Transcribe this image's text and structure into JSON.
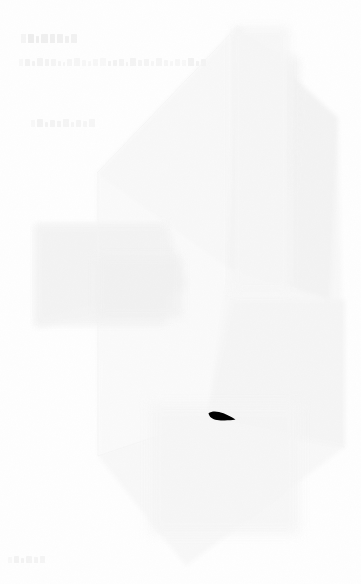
{
  "canvas": {
    "width": 361,
    "height": 584,
    "background_color": "#fefefe",
    "description": "Extremely faded near-white screenshot with illegible text and a large ghost polygon"
  },
  "palette": {
    "background": "#fefefe",
    "ghost_light": "#f9f9f9",
    "ghost_mid": "#f4f4f4",
    "ghost_dark": "#efefef",
    "text_ghost": "#f2f2f2",
    "cursor": "#000000"
  },
  "text_blocks": [
    {
      "name": "title",
      "legible": false,
      "text": "",
      "x": 21,
      "y": 34,
      "width": 48,
      "height": 12,
      "glyph_widths": [
        5,
        6,
        3,
        7,
        5,
        6,
        4,
        6
      ],
      "glyph_heights": [
        9,
        9,
        7,
        9,
        9,
        9,
        7,
        9
      ]
    },
    {
      "name": "subtitle",
      "legible": false,
      "text": "",
      "x": 19,
      "y": 58,
      "width": 170,
      "height": 10,
      "glyph_widths": [
        4,
        5,
        3,
        6,
        4,
        5,
        3,
        2,
        5,
        6,
        4,
        3,
        5,
        6,
        3,
        4,
        5,
        2,
        6,
        4,
        5,
        3,
        6,
        4,
        3,
        5,
        4,
        6,
        3,
        5
      ],
      "glyph_heights": [
        7,
        7,
        5,
        8,
        7,
        7,
        5,
        4,
        7,
        8,
        6,
        5,
        7,
        8,
        5,
        6,
        7,
        4,
        8,
        6,
        7,
        5,
        8,
        6,
        5,
        7,
        6,
        8,
        5,
        7
      ]
    },
    {
      "name": "third-line",
      "legible": false,
      "text": "",
      "x": 31,
      "y": 119,
      "width": 56,
      "height": 10,
      "glyph_widths": [
        4,
        6,
        3,
        5,
        4,
        6,
        3,
        5,
        4,
        6
      ],
      "glyph_heights": [
        7,
        8,
        5,
        7,
        6,
        8,
        5,
        7,
        6,
        8
      ]
    },
    {
      "name": "corner-mark",
      "legible": false,
      "text": "",
      "x": 8,
      "y": 556,
      "width": 38,
      "height": 9,
      "glyph_widths": [
        4,
        5,
        3,
        6,
        4,
        5
      ],
      "glyph_heights": [
        6,
        7,
        5,
        7,
        6,
        7
      ]
    }
  ],
  "ghost_shapes": [
    {
      "name": "main-polygon",
      "type": "polygon",
      "points": "97,173 238,26 338,118 345,447 186,566 98,456",
      "fill": "#f8f8f8"
    },
    {
      "name": "upper-right-facet",
      "type": "polygon",
      "points": "238,26 338,118 330,300 228,268",
      "fill": "#f4f4f4"
    },
    {
      "name": "lower-right-facet",
      "type": "polygon",
      "points": "232,300 345,300 345,447 206,420",
      "fill": "#f6f6f6"
    },
    {
      "name": "content-block",
      "type": "rect",
      "x": 35,
      "y": 224,
      "width": 132,
      "height": 102,
      "fill": "#f4f4f4"
    },
    {
      "name": "right-band",
      "type": "rect",
      "x": 232,
      "y": 26,
      "width": 58,
      "height": 266,
      "fill": "#f7f7f7"
    }
  ],
  "cursor": {
    "name": "pointer-wedge",
    "shape": "wedge",
    "x": 207,
    "y": 410,
    "width": 30,
    "height": 15,
    "color": "#000000",
    "description": "solid black wedge, thick at left tapering to a point at right"
  }
}
